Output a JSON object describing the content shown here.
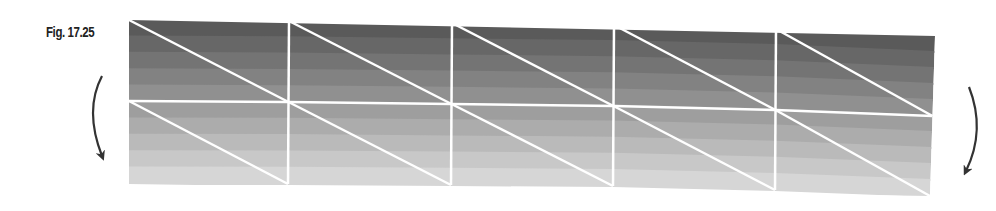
{
  "figure": {
    "label": "Fig. 17.25"
  },
  "mesh": {
    "columns": 5,
    "rows": 2,
    "nodes_top_x": [
      129,
      289,
      452,
      614,
      776,
      935
    ],
    "nodes_top_y": [
      20,
      21,
      23,
      25,
      29,
      36
    ],
    "nodes_mid_y": [
      101,
      102,
      104,
      106,
      110,
      116
    ],
    "nodes_bottom_y": [
      184,
      184,
      185,
      186,
      190,
      196
    ],
    "line_color": "#ffffff",
    "band_colors": [
      "#5a5a5a",
      "#676767",
      "#747474",
      "#828282",
      "#909090",
      "#9e9e9e",
      "#acacac",
      "#bababa",
      "#c8c8c8",
      "#d6d6d6"
    ]
  },
  "arrows": {
    "left": {
      "direction": "counterclockwise-down",
      "color": "#333333"
    },
    "right": {
      "direction": "clockwise-down",
      "color": "#333333"
    }
  }
}
